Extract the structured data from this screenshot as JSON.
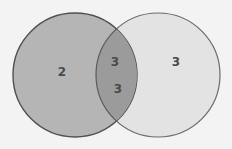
{
  "diagram": {
    "type": "venn",
    "sets": [
      {
        "id": "left",
        "label": "2",
        "fill": "#b5b5b5",
        "stroke": "#505050"
      },
      {
        "id": "right",
        "label": "3",
        "fill": "#e3e3e3",
        "stroke": "#6a6a6a"
      }
    ],
    "intersection": {
      "labels": [
        "3",
        "3"
      ],
      "fill": "#9b9b9b"
    },
    "background": "#f3f3f3"
  }
}
